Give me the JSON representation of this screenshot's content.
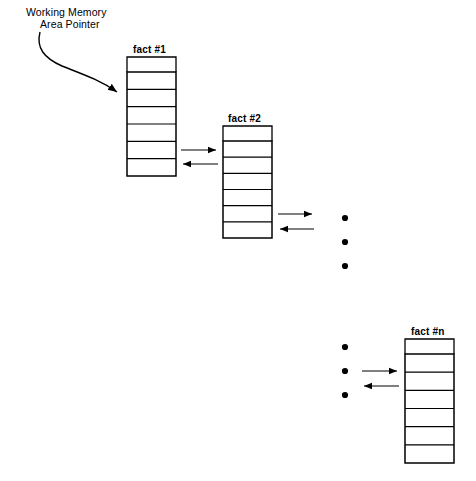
{
  "figure": {
    "type": "diagram",
    "background_color": "#ffffff",
    "stroke_color": "#000000",
    "width": 476,
    "height": 481
  },
  "annotation": {
    "pointer_label_line1": "Working Memory",
    "pointer_label_line2": "Area Pointer",
    "pointer_arrow": "curved-arrow-to-fact-1"
  },
  "blocks": [
    {
      "id": "fact-1",
      "label": "fact #1",
      "cells": 6,
      "x": 127,
      "y": 72,
      "width": 49,
      "height": 104,
      "bracket_y": 57,
      "bracket_height": 15,
      "label_x": 133,
      "label_y": 44
    },
    {
      "id": "fact-2",
      "label": "fact #2",
      "cells": 6,
      "x": 223,
      "y": 141,
      "width": 49,
      "height": 97,
      "bracket_y": 126,
      "bracket_height": 15,
      "label_x": 228,
      "label_y": 113
    },
    {
      "id": "fact-n",
      "label": "fact #n",
      "cells": 6,
      "x": 405,
      "y": 354,
      "width": 49,
      "height": 109,
      "bracket_y": 339,
      "bracket_height": 15,
      "label_x": 411,
      "label_y": 326
    }
  ],
  "link_arrows": [
    {
      "id": "fact1-to-fact2-forward",
      "direction": "right",
      "x1": 181,
      "y1": 150,
      "x2": 218,
      "y2": 150
    },
    {
      "id": "fact2-to-fact1-back",
      "direction": "left",
      "x1": 218,
      "y1": 164,
      "x2": 181,
      "y2": 164
    },
    {
      "id": "fact2-to-next-forward",
      "direction": "right",
      "x1": 278,
      "y1": 214,
      "x2": 314,
      "y2": 214
    },
    {
      "id": "next-to-fact2-back",
      "direction": "left",
      "x1": 314,
      "y1": 229,
      "x2": 278,
      "y2": 229
    },
    {
      "id": "prev-to-factn-forward",
      "direction": "right",
      "x1": 362,
      "y1": 371,
      "x2": 399,
      "y2": 371
    },
    {
      "id": "factn-to-prev-back",
      "direction": "left",
      "x1": 399,
      "y1": 386,
      "x2": 362,
      "y2": 386
    }
  ],
  "ellipses": [
    {
      "id": "ellipsis-upper",
      "dots": 3,
      "cx": 345,
      "cy_list": [
        218,
        242,
        266
      ],
      "r": 3
    },
    {
      "id": "ellipsis-lower",
      "dots": 3,
      "cx": 345,
      "cy_list": [
        347,
        371,
        395
      ],
      "r": 3
    }
  ]
}
